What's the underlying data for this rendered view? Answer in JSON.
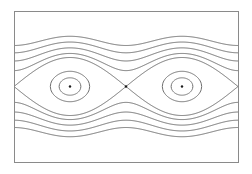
{
  "diagram": {
    "type": "phase-portrait",
    "frame": {
      "x": 14,
      "y": 11,
      "width": 224,
      "height": 151
    },
    "colors": {
      "curve": "#6f6f6f",
      "frame": "#8a8a8a",
      "point": "#1a1a1a"
    },
    "axis": {
      "center_y": 86.5,
      "period_px": 112,
      "theta0_x": 70,
      "p_scale_px": 14.5
    },
    "centers": [
      {
        "x": 70,
        "y": 86.5
      },
      {
        "x": 182,
        "y": 86.5
      }
    ],
    "saddles": [
      {
        "x": 126,
        "y": 86.5
      }
    ],
    "closed_orbits_energy": [
      -0.82,
      -0.45
    ],
    "separatrix_energy": 1.0,
    "open_orbits_energy": [
      1.6,
      2.55,
      3.7,
      5.0
    ]
  }
}
